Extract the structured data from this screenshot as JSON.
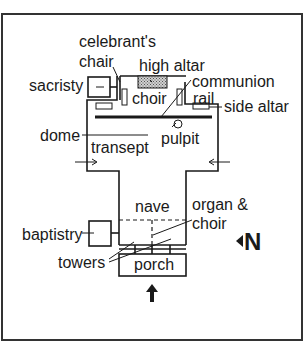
{
  "diagram": {
    "type": "church floor plan",
    "labels": {
      "celebrants_chair_1": "celebrant's",
      "celebrants_chair_2": "chair",
      "high_altar": "high altar",
      "sacristy": "sacristy",
      "choir": "choir",
      "communion_1": "communion",
      "communion_2": "rail",
      "side_altar": "side altar",
      "dome": "dome",
      "transept": "transept",
      "pulpit": "pulpit",
      "nave": "nave",
      "organ_1": "organ &",
      "organ_2": "choir",
      "baptistry": "baptistry",
      "towers": "towers",
      "porch": "porch",
      "north": "N"
    },
    "colors": {
      "ink": "#1a1a1a",
      "background": "#ffffff",
      "altar_fill": "#9a9a9a"
    }
  }
}
